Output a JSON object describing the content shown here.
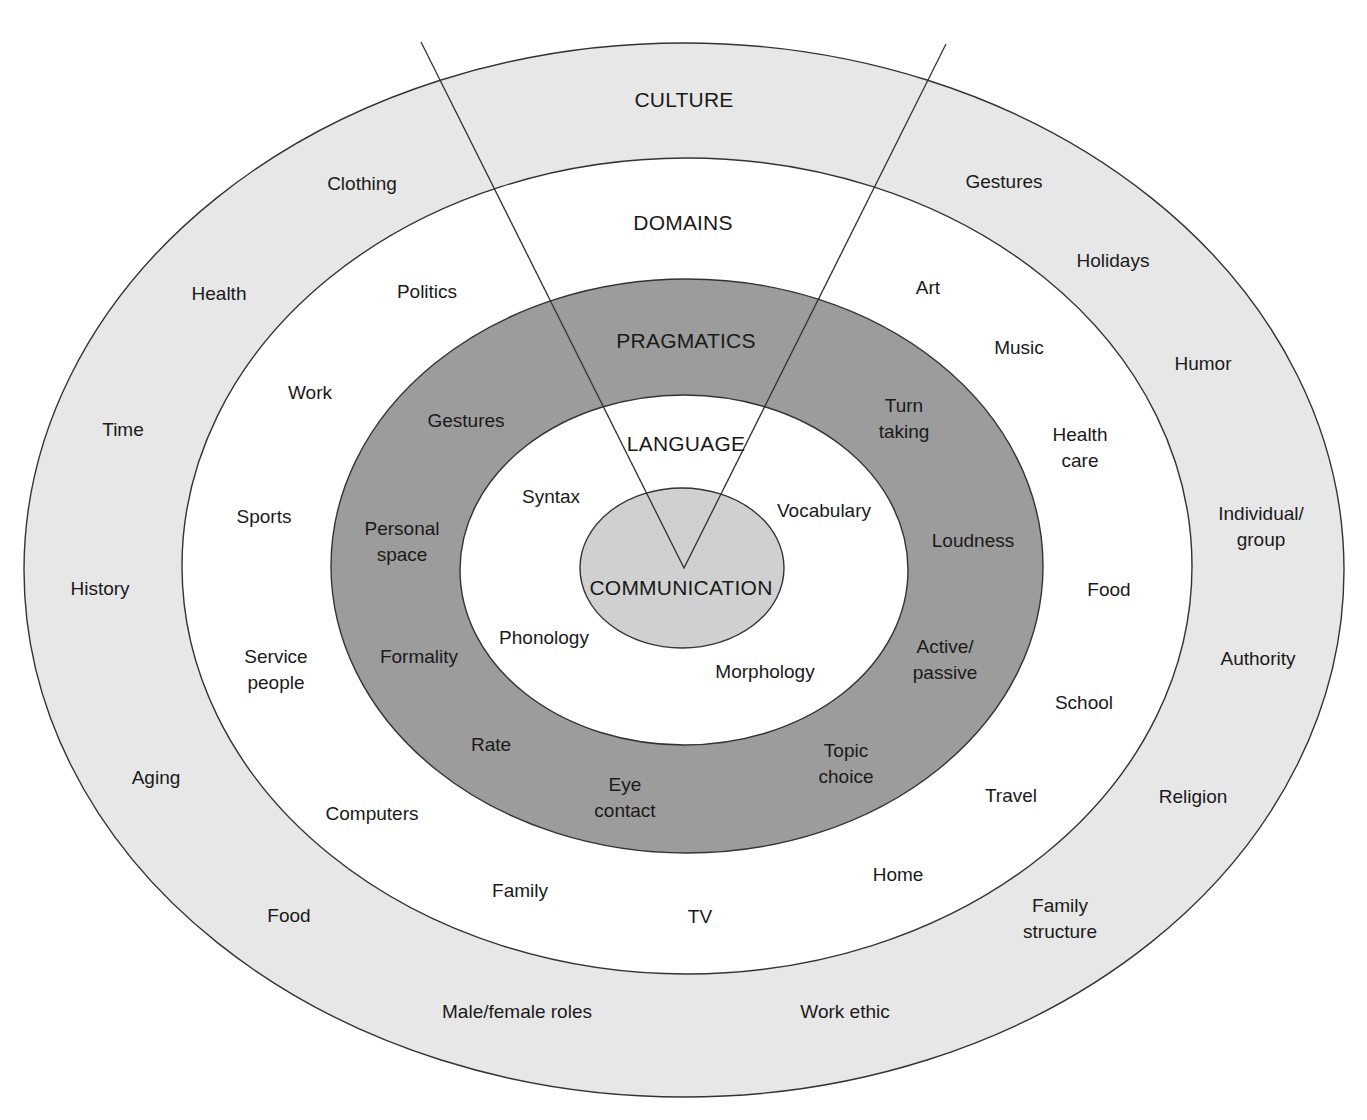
{
  "diagram": {
    "type": "concentric-ellipses",
    "colors": {
      "culture_fill": "#e7e7e7",
      "domains_fill": "#ffffff",
      "pragmatics_fill": "#9c9c9c",
      "language_fill": "#ffffff",
      "communication_fill": "#d0d0d0",
      "stroke": "#333333",
      "text": "#1a1a1a"
    },
    "layers": [
      {
        "id": "culture",
        "heading": "CULTURE",
        "heading_pos": [
          684,
          100
        ],
        "ellipse": {
          "cx": 684,
          "cy": 570,
          "rx": 660,
          "ry": 527
        },
        "items": [
          {
            "text": "Clothing",
            "pos": [
              362,
              184
            ]
          },
          {
            "text": "Gestures",
            "pos": [
              1004,
              182
            ]
          },
          {
            "text": "Health",
            "pos": [
              219,
              294
            ]
          },
          {
            "text": "Holidays",
            "pos": [
              1113,
              261
            ]
          },
          {
            "text": "Time",
            "pos": [
              123,
              430
            ]
          },
          {
            "text": "Humor",
            "pos": [
              1203,
              364
            ]
          },
          {
            "text": "History",
            "pos": [
              100,
              589
            ]
          },
          {
            "text": "Individual/\ngroup",
            "pos": [
              1261,
              527
            ]
          },
          {
            "text": "Authority",
            "pos": [
              1258,
              659
            ]
          },
          {
            "text": "Aging",
            "pos": [
              156,
              778
            ]
          },
          {
            "text": "Religion",
            "pos": [
              1193,
              797
            ]
          },
          {
            "text": "Food",
            "pos": [
              289,
              916
            ]
          },
          {
            "text": "Family\nstructure",
            "pos": [
              1060,
              919
            ]
          },
          {
            "text": "Male/female roles",
            "pos": [
              517,
              1012
            ]
          },
          {
            "text": "Work ethic",
            "pos": [
              845,
              1012
            ]
          }
        ]
      },
      {
        "id": "domains",
        "heading": "DOMAINS",
        "heading_pos": [
          683,
          223
        ],
        "ellipse": {
          "cx": 687,
          "cy": 566,
          "rx": 505,
          "ry": 408
        },
        "items": [
          {
            "text": "Politics",
            "pos": [
              427,
              292
            ]
          },
          {
            "text": "Art",
            "pos": [
              928,
              288
            ]
          },
          {
            "text": "Music",
            "pos": [
              1019,
              348
            ]
          },
          {
            "text": "Work",
            "pos": [
              310,
              393
            ]
          },
          {
            "text": "Health\ncare",
            "pos": [
              1080,
              448
            ]
          },
          {
            "text": "Sports",
            "pos": [
              264,
              517
            ]
          },
          {
            "text": "Food",
            "pos": [
              1109,
              590
            ]
          },
          {
            "text": "Service\npeople",
            "pos": [
              276,
              670
            ]
          },
          {
            "text": "School",
            "pos": [
              1084,
              703
            ]
          },
          {
            "text": "Travel",
            "pos": [
              1011,
              796
            ]
          },
          {
            "text": "Computers",
            "pos": [
              372,
              814
            ]
          },
          {
            "text": "Home",
            "pos": [
              898,
              875
            ]
          },
          {
            "text": "Family",
            "pos": [
              520,
              891
            ]
          },
          {
            "text": "TV",
            "pos": [
              700,
              917
            ]
          }
        ]
      },
      {
        "id": "pragmatics",
        "heading": "PRAGMATICS",
        "heading_pos": [
          686,
          341
        ],
        "ellipse": {
          "cx": 687,
          "cy": 566,
          "rx": 356,
          "ry": 287
        },
        "items": [
          {
            "text": "Gestures",
            "pos": [
              466,
              421
            ]
          },
          {
            "text": "Turn\ntaking",
            "pos": [
              904,
              419
            ]
          },
          {
            "text": "Personal\nspace",
            "pos": [
              402,
              542
            ]
          },
          {
            "text": "Loudness",
            "pos": [
              973,
              541
            ]
          },
          {
            "text": "Formality",
            "pos": [
              419,
              657
            ]
          },
          {
            "text": "Active/\npassive",
            "pos": [
              945,
              660
            ]
          },
          {
            "text": "Rate",
            "pos": [
              491,
              745
            ]
          },
          {
            "text": "Topic\nchoice",
            "pos": [
              846,
              764
            ]
          },
          {
            "text": "Eye\ncontact",
            "pos": [
              625,
              798
            ]
          }
        ]
      },
      {
        "id": "language",
        "heading": "LANGUAGE",
        "heading_pos": [
          686,
          444
        ],
        "ellipse": {
          "cx": 684,
          "cy": 570,
          "rx": 224,
          "ry": 175
        },
        "items": [
          {
            "text": "Syntax",
            "pos": [
              551,
              497
            ]
          },
          {
            "text": "Vocabulary",
            "pos": [
              824,
              511
            ]
          },
          {
            "text": "Phonology",
            "pos": [
              544,
              638
            ]
          },
          {
            "text": "Morphology",
            "pos": [
              765,
              672
            ]
          }
        ]
      },
      {
        "id": "communication",
        "heading": "COMMUNICATION",
        "heading_pos": [
          681,
          588
        ],
        "ellipse": {
          "cx": 682,
          "cy": 568,
          "rx": 102,
          "ry": 80
        },
        "items": []
      }
    ],
    "wedge": {
      "vertex": [
        684,
        568
      ],
      "left_end": [
        421,
        42
      ],
      "right_end": [
        946,
        44
      ]
    }
  }
}
